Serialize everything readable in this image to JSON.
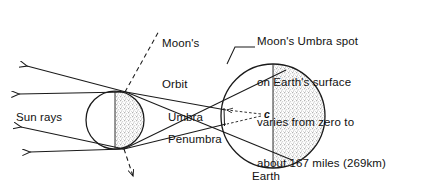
{
  "diagram": {
    "labels": {
      "sun_rays": "Sun rays",
      "umbra": "Umbra",
      "penumbra": "Penumbra",
      "earth": "Earth",
      "umbra_spot_marker": "c"
    },
    "moon_orbit_label": {
      "line1": "Moon's",
      "line2": "Orbit"
    },
    "callout": {
      "line1": "Moon's Umbra spot",
      "line2": "on Earth's surface",
      "line3": "varies from zero to",
      "line4": "about 167 miles (269km)"
    },
    "values": {
      "umbra_spot_min": "zero",
      "umbra_spot_max_miles": "167 miles",
      "umbra_spot_max_km": "269km"
    },
    "colors": {
      "background": "#ffffff",
      "ink": "#1a1a1a",
      "shading": "#b9b9b9"
    },
    "bodies": {
      "moon": {
        "name": "Moon",
        "cx": 115,
        "cy": 120,
        "r": 29,
        "shaded_half": "right"
      },
      "earth": {
        "name": "Earth",
        "cx": 273,
        "cy": 116,
        "r": 52,
        "shaded_half": "right"
      }
    },
    "ray_count": 4
  }
}
